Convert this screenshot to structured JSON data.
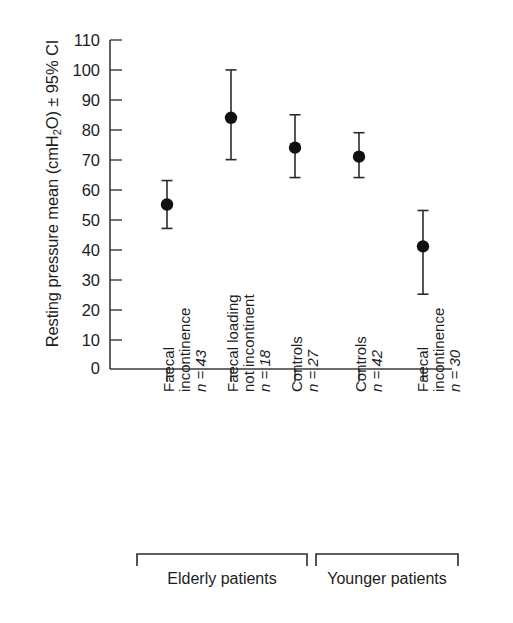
{
  "chart_data": {
    "type": "scatter",
    "title": "",
    "xlabel": "",
    "ylabel": "Resting pressure mean (cmH2O) ± 95% CI",
    "ylabel_parts": {
      "pre": "Resting pressure mean (cmH",
      "sub": "2",
      "post": "O) ± 95% CI"
    },
    "ylim": [
      0,
      110
    ],
    "ytick_values": [
      0,
      10,
      20,
      30,
      40,
      50,
      60,
      70,
      80,
      90,
      100,
      110
    ],
    "ytick_labels": [
      "0",
      "10",
      "20",
      "30",
      "40",
      "50",
      "60",
      "70",
      "80",
      "90",
      "100",
      "110"
    ],
    "grid": false,
    "legend": "none",
    "error_bar_style": "95% CI with caps",
    "marker": "filled-circle",
    "marker_color": "#111111",
    "axis_color": "#3a3a3a",
    "categories": [
      "Faecal incontinence n = 43",
      "Faecal loading not incontinent n = 18",
      "Controls n = 27",
      "Controls n = 42",
      "Faecal incontinence n = 30"
    ],
    "points": [
      {
        "label_line1": "Faecal",
        "label_line2": "incontinence",
        "n_label": "n = 43",
        "mean": 55,
        "ci_low": 47,
        "ci_high": 63,
        "group": "Elderly patients"
      },
      {
        "label_line1": "Faecal loading",
        "label_line2": "not incontinent",
        "n_label": "n = 18",
        "mean": 84,
        "ci_low": 70,
        "ci_high": 100,
        "group": "Elderly patients"
      },
      {
        "label_line1": "Controls",
        "label_line2": "",
        "n_label": "n = 27",
        "mean": 74,
        "ci_low": 64,
        "ci_high": 85,
        "group": "Elderly patients"
      },
      {
        "label_line1": "Controls",
        "label_line2": "",
        "n_label": "n = 42",
        "mean": 71,
        "ci_low": 64,
        "ci_high": 79,
        "group": "Younger patients"
      },
      {
        "label_line1": "Faecal",
        "label_line2": "incontinence",
        "n_label": "n = 30",
        "mean": 41,
        "ci_low": 25,
        "ci_high": 53,
        "group": "Younger patients"
      }
    ],
    "groups": [
      {
        "label": "Elderly patients",
        "members": [
          0,
          1,
          2
        ]
      },
      {
        "label": "Younger patients",
        "members": [
          3,
          4
        ]
      }
    ]
  }
}
